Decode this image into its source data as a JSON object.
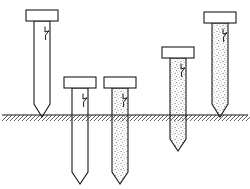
{
  "figure": {
    "background_color": "#ffffff",
    "line_color": "#1a1a1a",
    "fill_color": "#ffffff",
    "stipple_color": "#8a8a8a",
    "width": 250,
    "height": 189
  },
  "ground": {
    "label": "ground-surface-line",
    "y": 115,
    "x_start": 2,
    "x_end": 248,
    "hatch_count": 62,
    "hatch_depth": 6,
    "hatch_spacing": 4,
    "color": "#1a1a1a"
  },
  "piles": [
    {
      "id": "pile-1",
      "label": "Pile 1",
      "fill": "hollow",
      "cap": {
        "x": 26,
        "y": 10,
        "width": 32,
        "height": 11
      },
      "shaft": {
        "left": 34,
        "right": 50,
        "top": 21,
        "tip_shoulder": 104,
        "tip_point": 117
      },
      "break_mark": {
        "x": 45,
        "y": 27
      },
      "tip_depth_below_ground": 0
    },
    {
      "id": "pile-2",
      "label": "Pile 2",
      "fill": "hollow",
      "cap": {
        "x": 64,
        "y": 77,
        "width": 32,
        "height": 11
      },
      "shaft": {
        "left": 72,
        "right": 88,
        "top": 88,
        "tip_shoulder": 172,
        "tip_point": 184
      },
      "break_mark": {
        "x": 83,
        "y": 94
      },
      "tip_depth_below_ground": 69
    },
    {
      "id": "pile-3",
      "label": "Pile 3",
      "fill": "concrete",
      "cap": {
        "x": 104,
        "y": 77,
        "width": 32,
        "height": 11
      },
      "shaft": {
        "left": 112,
        "right": 128,
        "top": 88,
        "tip_shoulder": 172,
        "tip_point": 184
      },
      "break_mark": {
        "x": 123,
        "y": 94
      },
      "tip_depth_below_ground": 69
    },
    {
      "id": "pile-4",
      "label": "Pile 4",
      "fill": "concrete",
      "cap": {
        "x": 162,
        "y": 47,
        "width": 32,
        "height": 11
      },
      "shaft": {
        "left": 170,
        "right": 186,
        "top": 58,
        "tip_shoulder": 139,
        "tip_point": 151
      },
      "break_mark": {
        "x": 181,
        "y": 64
      },
      "tip_depth_below_ground": 36
    },
    {
      "id": "pile-5",
      "label": "Pile 5",
      "fill": "concrete",
      "cap": {
        "x": 204,
        "y": 12,
        "width": 32,
        "height": 11
      },
      "shaft": {
        "left": 212,
        "right": 228,
        "top": 23,
        "tip_shoulder": 104,
        "tip_point": 117
      },
      "break_mark": {
        "x": 223,
        "y": 29
      },
      "tip_depth_below_ground": 0
    }
  ]
}
